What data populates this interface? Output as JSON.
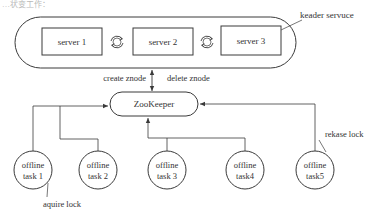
{
  "header_fragment": "…状变工作：",
  "leader_service": {
    "label": "keader servuce",
    "servers": [
      {
        "id": "server1",
        "label": "server 1"
      },
      {
        "id": "server2",
        "label": "server 2"
      },
      {
        "id": "server3",
        "label": "server 3"
      }
    ]
  },
  "arrows": {
    "create_label": "create znode",
    "delete_label": "delete znode"
  },
  "zookeeper": {
    "label": "ZooKeeper"
  },
  "tasks": [
    {
      "id": "task1",
      "line1": "offline",
      "line2": "task 1"
    },
    {
      "id": "task2",
      "line1": "offline",
      "line2": "task 2"
    },
    {
      "id": "task3",
      "line1": "offline",
      "line2": "task 3"
    },
    {
      "id": "task4",
      "line1": "offline",
      "line2": "task4"
    },
    {
      "id": "task5",
      "line1": "offline",
      "line2": "task5"
    }
  ],
  "annotations": {
    "acquire": "aquire lock",
    "release": "rekase lock"
  },
  "colors": {
    "stroke": "#3a3a3a",
    "text": "#333333",
    "background": "#ffffff"
  }
}
